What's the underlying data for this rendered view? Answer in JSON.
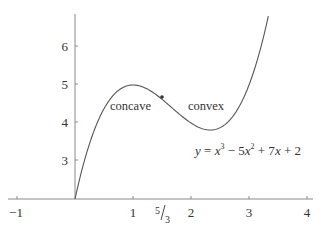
{
  "chart_data": {
    "type": "line",
    "title": "",
    "xlabel": "",
    "ylabel": "",
    "function": "y = x^3 - 5x^2 + 7x + 2",
    "xlim": [
      -1,
      4
    ],
    "ylim": [
      2,
      6.8
    ],
    "grid": false,
    "x_ticks": [
      {
        "value": -1,
        "label": "−1"
      },
      {
        "value": 1,
        "label": "1"
      },
      {
        "value": 1.6667,
        "label": "5/3"
      },
      {
        "value": 2,
        "label": "2"
      },
      {
        "value": 3,
        "label": "3"
      },
      {
        "value": 4,
        "label": "4"
      }
    ],
    "y_ticks": [
      {
        "value": 3,
        "label": "3"
      },
      {
        "value": 4,
        "label": "4"
      },
      {
        "value": 5,
        "label": "5"
      },
      {
        "value": 6,
        "label": "6"
      }
    ],
    "series": [
      {
        "name": "y = x^3 - 5x^2 + 7x + 2",
        "x": [
          0,
          0.25,
          0.5,
          0.75,
          1,
          1.25,
          1.5,
          1.6667,
          1.75,
          2,
          2.25,
          2.3333,
          2.5,
          2.75,
          3,
          3.25,
          3.35
        ],
        "y": [
          2,
          3.45,
          4.38,
          4.86,
          5,
          4.89,
          4.63,
          4.44,
          4.11,
          4,
          3.86,
          3.85,
          3.88,
          4.05,
          5,
          6.36,
          6.85
        ]
      }
    ],
    "annotations": [
      {
        "text": "concave",
        "x": 1.0,
        "y": 4.55
      },
      {
        "text": "convex",
        "x": 2.1,
        "y": 4.55
      },
      {
        "text": "y = x³ − 5x² + 7x + 2",
        "x": 3.2,
        "y": 3.55
      },
      {
        "text": "inflection point",
        "x": 1.6667,
        "y": 4.4444,
        "marker": "dot"
      }
    ]
  },
  "labels": {
    "concave": "concave",
    "convex": "convex",
    "eq": {
      "y": "y",
      "eq1": " = ",
      "x1": "x",
      "p1": "3",
      "m1": " − 5",
      "x2": "x",
      "p2": "2",
      "m2": " + 7",
      "x3": "x",
      "m3": " + 2"
    },
    "x_ticks": {
      "m1": "−1",
      "one": "1",
      "fnum": "5",
      "fden": "3",
      "two": "2",
      "three": "3",
      "four": "4"
    },
    "y_ticks": {
      "three": "3",
      "four": "4",
      "five": "5",
      "six": "6"
    }
  },
  "colors": {
    "axis": "#8a8a8a",
    "curve": "#555555",
    "text": "#333333"
  }
}
